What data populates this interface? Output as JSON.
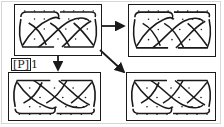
{
  "diagram": {
    "type": "knot-pattern-transformation",
    "label": {
      "bracket": "P",
      "suffix": "1"
    },
    "panels": [
      {
        "id": "source",
        "position": "top-left",
        "pattern": "celtic-braid-knot",
        "orientation": "normal"
      },
      {
        "id": "result-right",
        "position": "top-right",
        "pattern": "celtic-braid-knot",
        "orientation": "normal"
      },
      {
        "id": "result-down",
        "position": "bottom-left",
        "pattern": "celtic-braid-knot",
        "orientation": "flipped-vertical"
      },
      {
        "id": "result-diagonal",
        "position": "bottom-right",
        "pattern": "celtic-braid-knot",
        "orientation": "flipped-vertical"
      }
    ],
    "arrows": [
      {
        "from": "source",
        "to": "result-right",
        "direction": "right"
      },
      {
        "from": "source",
        "to": "result-down",
        "direction": "down"
      },
      {
        "from": "source",
        "to": "result-diagonal",
        "direction": "down-right"
      }
    ],
    "colors": {
      "ink": "#1a1a1a",
      "background": "#ffffff",
      "frame": "#d6d6d6"
    }
  }
}
